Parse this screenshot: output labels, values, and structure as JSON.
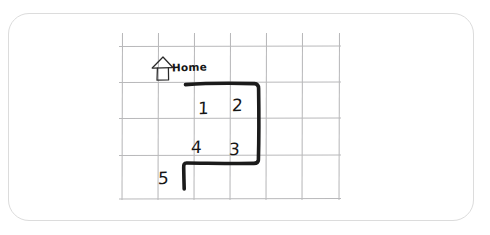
{
  "canvas": {
    "width": 490,
    "height": 235,
    "background_color": "#ffffff",
    "card_border_color": "#dcdcdc",
    "grid_line_color": "#b9b9bb",
    "route_color": "#1b1b1b",
    "ink_color": "#161616"
  },
  "grid": {
    "columns": 6,
    "rows": 4,
    "x_positions": [
      122,
      158,
      194,
      230,
      266,
      302,
      340
    ],
    "y_positions": [
      33,
      46,
      82,
      118,
      155,
      191,
      199
    ]
  },
  "home_marker": {
    "icon": "house-icon",
    "label": "Home",
    "x": 152,
    "y": 54
  },
  "route": {
    "label": "numbered-path",
    "stroke_width": 3.6,
    "points": [
      {
        "x": 186,
        "y": 84
      },
      {
        "x": 258,
        "y": 84
      },
      {
        "x": 258,
        "y": 163
      },
      {
        "x": 186,
        "y": 163
      },
      {
        "x": 186,
        "y": 189
      }
    ]
  },
  "cells": [
    {
      "label": "1",
      "x": 198,
      "y": 100,
      "row": 1,
      "col": 1
    },
    {
      "label": "2",
      "x": 232,
      "y": 97,
      "row": 1,
      "col": 2
    },
    {
      "label": "4",
      "x": 191,
      "y": 139,
      "row": 2,
      "col": 1
    },
    {
      "label": "3",
      "x": 229,
      "y": 141,
      "row": 2,
      "col": 2
    },
    {
      "label": "5",
      "x": 158,
      "y": 170,
      "row": 3,
      "col": 0
    }
  ]
}
